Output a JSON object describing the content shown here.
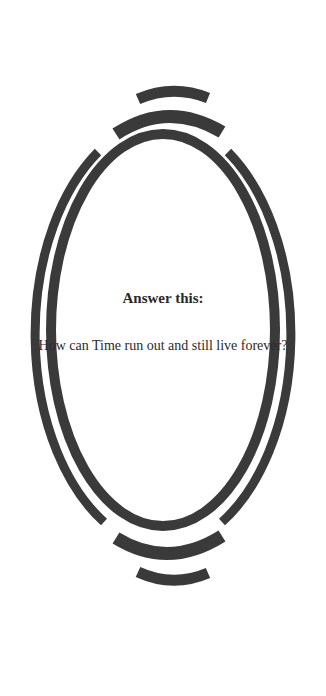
{
  "prompt": {
    "title": "Answer this:",
    "question": "How can Time run out and still live forever?"
  },
  "frame": {
    "shape": "ornamental-ellipse-ring",
    "color": "#3a3a3a",
    "background": "#ffffff"
  }
}
